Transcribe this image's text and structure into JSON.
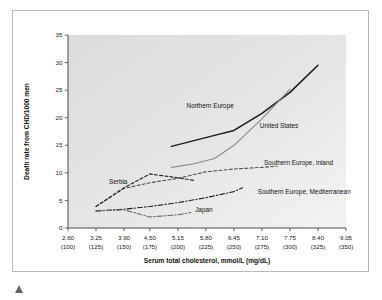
{
  "figure": {
    "caption_marker": "triangle-marker"
  },
  "chart_data": {
    "type": "line",
    "title": "",
    "xlabel": "Serum total cholesterol, mmol/L (mg/dL)",
    "ylabel": "Death rate from CHD/1000 men",
    "xlim": [
      2.6,
      9.05
    ],
    "ylim": [
      0,
      35
    ],
    "grid": false,
    "legend_position": "inline-annotations",
    "plot_background": "#e3e3e3",
    "x_tick_values": [
      2.6,
      3.25,
      3.9,
      4.5,
      5.15,
      5.8,
      6.45,
      7.1,
      7.75,
      8.4,
      9.05
    ],
    "x_tick_labels": [
      "2.60",
      "3.25",
      "3.90",
      "4.50",
      "5.15",
      "5.80",
      "6.45",
      "7.10",
      "7.75",
      "8.40",
      "9.05"
    ],
    "x_tick_labels_secondary": [
      "(100)",
      "(125)",
      "(150)",
      "(175)",
      "(200)",
      "(225)",
      "(250)",
      "(275)",
      "(300)",
      "(325)",
      "(350)"
    ],
    "y_tick_values": [
      0,
      5,
      10,
      15,
      20,
      25,
      30,
      35
    ],
    "y_tick_labels": [
      "0",
      "5",
      "10",
      "15",
      "20",
      "25",
      "30",
      "35"
    ],
    "series": [
      {
        "name": "Northern Europe",
        "style": "solid",
        "color": "#1a1a1a",
        "width": 1.5,
        "label_x": 5.35,
        "label_y": 21.8,
        "x": [
          5.0,
          5.5,
          6.0,
          6.45,
          7.1,
          7.75,
          8.4
        ],
        "y": [
          14.8,
          15.8,
          16.8,
          17.7,
          20.8,
          24.6,
          29.5
        ]
      },
      {
        "name": "United States",
        "style": "solid",
        "color": "#8a8a8a",
        "width": 1.1,
        "label_x": 7.05,
        "label_y": 18.2,
        "x": [
          5.0,
          5.5,
          6.0,
          6.45,
          7.1,
          7.75
        ],
        "y": [
          11.0,
          11.6,
          12.6,
          15.0,
          19.8,
          25.2
        ]
      },
      {
        "name": "Southern Europe, inland",
        "style": "dashed",
        "color": "#4d4d4d",
        "width": 1.1,
        "label_x": 7.15,
        "label_y": 11.4,
        "x": [
          3.25,
          3.9,
          4.5,
          5.15,
          5.8,
          6.45,
          7.1,
          7.45
        ],
        "y": [
          3.9,
          7.2,
          8.2,
          9.0,
          10.2,
          10.7,
          11.0,
          11.2
        ]
      },
      {
        "name": "Serbia",
        "style": "dashed",
        "color": "#2b2b2b",
        "width": 1.2,
        "label_x": 3.55,
        "label_y": 7.9,
        "x": [
          3.25,
          3.9,
          4.5,
          5.15,
          5.55
        ],
        "y": [
          3.9,
          7.3,
          9.8,
          9.1,
          8.6
        ]
      },
      {
        "name": "Southern Europe, Mediterranean",
        "style": "dashdot",
        "color": "#1f1f1f",
        "width": 1.1,
        "label_x": 7.0,
        "label_y": 6.1,
        "x": [
          3.25,
          3.9,
          4.5,
          5.15,
          5.8,
          6.45,
          6.65
        ],
        "y": [
          3.1,
          3.4,
          3.9,
          4.6,
          5.5,
          6.6,
          7.3
        ]
      },
      {
        "name": "Japan",
        "style": "dashdot",
        "color": "#6a6a6a",
        "width": 1.1,
        "label_x": 5.55,
        "label_y": 2.9,
        "x": [
          3.25,
          3.9,
          4.5,
          5.15,
          5.45
        ],
        "y": [
          3.1,
          3.3,
          2.0,
          2.4,
          2.8
        ]
      }
    ]
  }
}
